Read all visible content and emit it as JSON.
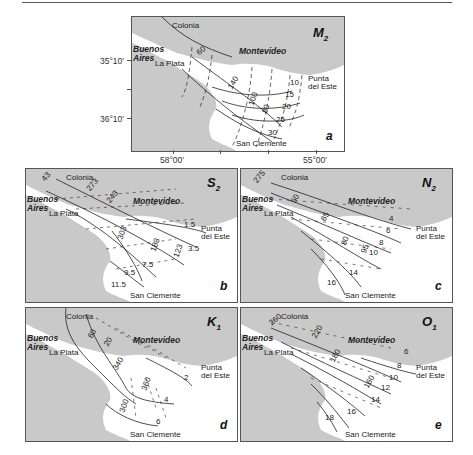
{
  "figure": {
    "panels": [
      {
        "id": "a",
        "constituent": "M",
        "subscript": "2",
        "panel_letter": "a",
        "amplitude_labels": [
          "10",
          "15",
          "20",
          "25",
          "30"
        ],
        "phase_labels": [
          "140",
          "120",
          "100",
          "80",
          "60"
        ]
      },
      {
        "id": "b",
        "constituent": "S",
        "subscript": "2",
        "panel_letter": "b",
        "amplitude_labels": [
          "1.5",
          "3.5",
          "5.5",
          "7.5",
          "9.5",
          "11.5"
        ],
        "phase_labels": [
          "43",
          "73",
          "303",
          "273",
          "243",
          "213",
          "183",
          "153",
          "123"
        ]
      },
      {
        "id": "c",
        "constituent": "N",
        "subscript": "2",
        "panel_letter": "c",
        "amplitude_labels": [
          "4",
          "6",
          "8",
          "10",
          "14",
          "16"
        ],
        "phase_labels": [
          "275",
          "35",
          "50",
          "65",
          "80",
          "95",
          "110"
        ]
      },
      {
        "id": "d",
        "constituent": "K",
        "subscript": "1",
        "panel_letter": "d",
        "amplitude_labels": [
          "2",
          "4",
          "6"
        ],
        "phase_labels": [
          "60",
          "20",
          "340",
          "360",
          "300"
        ]
      },
      {
        "id": "e",
        "constituent": "O",
        "subscript": "1",
        "panel_letter": "e",
        "amplitude_labels": [
          "6",
          "8",
          "10",
          "12",
          "14",
          "16",
          "18"
        ],
        "phase_labels": [
          "260",
          "220",
          "180",
          "160"
        ]
      }
    ],
    "places": {
      "colonia": "Colonia",
      "buenos_aires_1": "Buenos",
      "buenos_aires_2": "Aires",
      "la_plata": "La Plata",
      "montevideo": "Montevideo",
      "punta_1": "Punta",
      "punta_2": "del Este",
      "san_clemente": "San Clemente"
    },
    "axes": {
      "lat_ticks": [
        "35°10'",
        "36°10'"
      ],
      "lon_ticks": [
        "58°00'",
        "55°00'"
      ]
    },
    "colors": {
      "land": "#c9c9c9",
      "water": "#ffffff",
      "line": "#222222",
      "frame": "#555555"
    }
  }
}
